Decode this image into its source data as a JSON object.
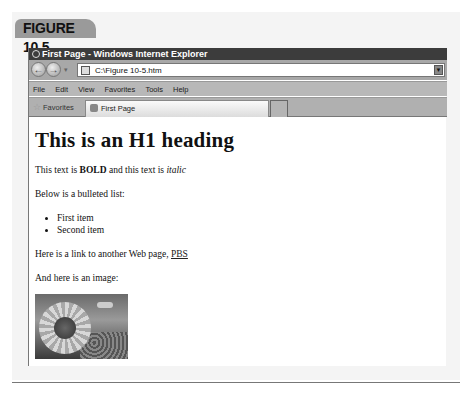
{
  "figure": {
    "label": "FIGURE 10.5"
  },
  "browser": {
    "title": "First Page - Windows Internet Explorer",
    "address": {
      "url": "C:\\Figure 10-5.htm"
    },
    "menu": [
      "File",
      "Edit",
      "View",
      "Favorites",
      "Tools",
      "Help"
    ],
    "favorites_label": "Favorites",
    "tabs": [
      {
        "label": "First Page",
        "active": true
      }
    ]
  },
  "page": {
    "heading": "This is an H1 heading",
    "line1": {
      "pre": "This text is ",
      "bold": "BOLD",
      "mid": " and this text is ",
      "italic": "italic"
    },
    "list_intro": "Below is a bulleted list:",
    "list_items": [
      "First item",
      "Second item"
    ],
    "link_line": {
      "pre": "Here is a link to another Web page, ",
      "link": "PBS"
    },
    "image_intro": "And here is an image:",
    "image": {
      "subject": "sunflower"
    }
  },
  "icons": {
    "back": "back-arrow-icon",
    "forward": "forward-arrow-icon",
    "page": "page-icon",
    "dropdown": "chevron-down-icon",
    "favorites": "star-icon",
    "ie": "internet-explorer-icon"
  }
}
